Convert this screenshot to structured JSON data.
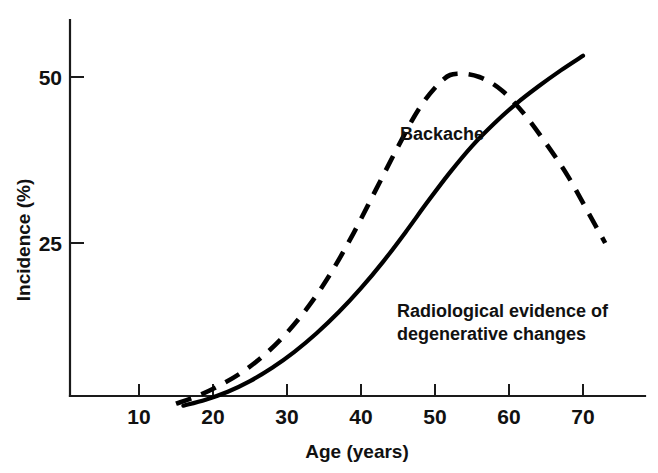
{
  "chart_data": {
    "type": "line",
    "title": "",
    "xlabel": "Age (years)",
    "ylabel": "Incidence (%)",
    "xlim": [
      0,
      78
    ],
    "ylim": [
      0,
      58
    ],
    "grid": false,
    "legend_position": "inline-annotations",
    "xticks": [
      10,
      20,
      30,
      40,
      50,
      60,
      70
    ],
    "xticklabels": [
      "10",
      "20",
      "30",
      "40",
      "50",
      "60",
      "70"
    ],
    "yticks": [
      25,
      50
    ],
    "yticklabels": [
      "25",
      "50"
    ],
    "series": [
      {
        "name": "Backache",
        "style": "dashed",
        "color": "#000000",
        "annotation": "Backache",
        "x": [
          15,
          18,
          21,
          24,
          27,
          30,
          33,
          36,
          39,
          42,
          45,
          48,
          51,
          53,
          56,
          59,
          62,
          65,
          68,
          71,
          73
        ],
        "values": [
          0.8,
          2.0,
          3.6,
          5.6,
          8.2,
          11.5,
          15.6,
          20.6,
          26.5,
          33.0,
          39.5,
          45.5,
          49.5,
          50.5,
          50.0,
          48.0,
          44.5,
          40.0,
          35.0,
          29.0,
          25.0
        ]
      },
      {
        "name": "Radiological evidence of degenerative changes",
        "style": "solid",
        "color": "#000000",
        "annotation": "Radiological evidence of\ndegenerative changes",
        "x": [
          16,
          19,
          22,
          25,
          28,
          31,
          34,
          37,
          40,
          43,
          46,
          49,
          52,
          55,
          58,
          61,
          64,
          67,
          70
        ],
        "values": [
          0.5,
          1.4,
          2.6,
          4.2,
          6.2,
          8.6,
          11.4,
          14.6,
          18.2,
          22.2,
          26.6,
          31.2,
          35.6,
          39.6,
          43.0,
          46.0,
          48.6,
          51.0,
          53.2
        ]
      }
    ],
    "annotations": [
      {
        "text": "Backache",
        "x": 45,
        "y": 38
      },
      {
        "text": "Radiological evidence of",
        "x": 53,
        "y": 18
      },
      {
        "text": "degenerative changes",
        "x": 53,
        "y": 14
      }
    ]
  },
  "labels": {
    "backache": "Backache",
    "radiological_line1": "Radiological evidence of",
    "radiological_line2": "degenerative changes",
    "x_axis_title": "Age (years)",
    "y_axis_title": "Incidence (%)",
    "ytick_25": "25",
    "ytick_50": "50",
    "xtick_10": "10",
    "xtick_20": "20",
    "xtick_30": "30",
    "xtick_40": "40",
    "xtick_50": "50",
    "xtick_60": "60",
    "xtick_70": "70"
  },
  "colors": {
    "ink": "#000000",
    "background": "#ffffff"
  }
}
